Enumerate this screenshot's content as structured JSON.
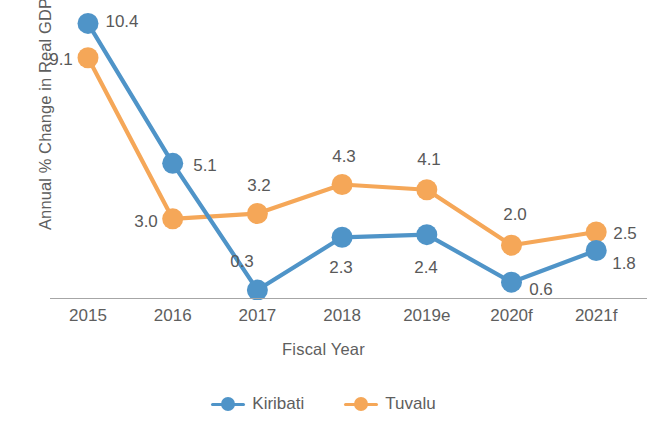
{
  "chart_data": {
    "type": "line",
    "title": "",
    "xlabel": "Fiscal Year",
    "ylabel": "Annual % Change in Real GDP",
    "categories": [
      "2015",
      "2016",
      "2017",
      "2018",
      "2019e",
      "2020f",
      "2021f"
    ],
    "ylim": [
      0,
      11
    ],
    "grid": false,
    "legend_position": "bottom",
    "series": [
      {
        "name": "Kiribati",
        "color": "#4f94c8",
        "values": [
          10.4,
          5.1,
          0.3,
          2.3,
          2.4,
          0.6,
          1.8
        ],
        "value_labels": [
          "10.4",
          "5.1",
          "0.3",
          "2.3",
          "2.4",
          "0.6",
          "1.8"
        ]
      },
      {
        "name": "Tuvalu",
        "color": "#f5a758",
        "values": [
          9.1,
          3.0,
          3.2,
          4.3,
          4.1,
          2.0,
          2.5
        ],
        "value_labels": [
          "9.1",
          "3.0",
          "3.2",
          "4.3",
          "4.1",
          "2.0",
          "2.5"
        ]
      }
    ]
  },
  "axis": {
    "y_title": "Annual % Change in Real GDP",
    "x_title": "Fiscal Year",
    "x_ticks": [
      "2015",
      "2016",
      "2017",
      "2018",
      "2019e",
      "2020f",
      "2021f"
    ]
  },
  "legend": {
    "items": [
      {
        "label": "Kiribati",
        "color": "#4f94c8"
      },
      {
        "label": "Tuvalu",
        "color": "#f5a758"
      }
    ]
  },
  "colors": {
    "kiribati": "#4f94c8",
    "tuvalu": "#f5a758",
    "text": "#5e5e5e",
    "data_label": "#595959",
    "axis_line": "#a6a6a6",
    "background": "#ffffff"
  },
  "label_positions": {
    "kiribati": [
      {
        "x": 122,
        "y": 22,
        "text": "10.4"
      },
      {
        "x": 205,
        "y": 166,
        "text": "5.1"
      },
      {
        "x": 242,
        "y": 262,
        "text": "0.3"
      },
      {
        "x": 341,
        "y": 268,
        "text": "2.3"
      },
      {
        "x": 426,
        "y": 268,
        "text": "2.4"
      },
      {
        "x": 541,
        "y": 290,
        "text": "0.6"
      },
      {
        "x": 624,
        "y": 264,
        "text": "1.8"
      }
    ],
    "tuvalu": [
      {
        "x": 61,
        "y": 60,
        "text": "9.1"
      },
      {
        "x": 146,
        "y": 222,
        "text": "3.0"
      },
      {
        "x": 259,
        "y": 186,
        "text": "3.2"
      },
      {
        "x": 344,
        "y": 157,
        "text": "4.3"
      },
      {
        "x": 429,
        "y": 160,
        "text": "4.1"
      },
      {
        "x": 515,
        "y": 215,
        "text": "2.0"
      },
      {
        "x": 625,
        "y": 234,
        "text": "2.5"
      }
    ]
  }
}
